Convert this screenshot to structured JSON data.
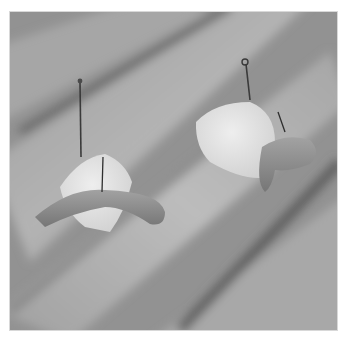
{
  "image": {
    "description": "Grayscale photograph of two baited fishing hooks resting on fingers",
    "subjects": [
      {
        "name": "left-hook",
        "bait": "worm wrapped around white cube"
      },
      {
        "name": "right-hook",
        "bait": "worm with white cube"
      }
    ],
    "colors": {
      "background": "#ffffff",
      "frame": "#d8d8d8",
      "skin_light": "#b4b4b4",
      "skin_mid": "#9a9a9a",
      "skin_shadow": "#5e5e5e",
      "bait_white": "#e6e6e6",
      "worm": "#8a8a8a",
      "hook": "#3a3a3a"
    }
  }
}
